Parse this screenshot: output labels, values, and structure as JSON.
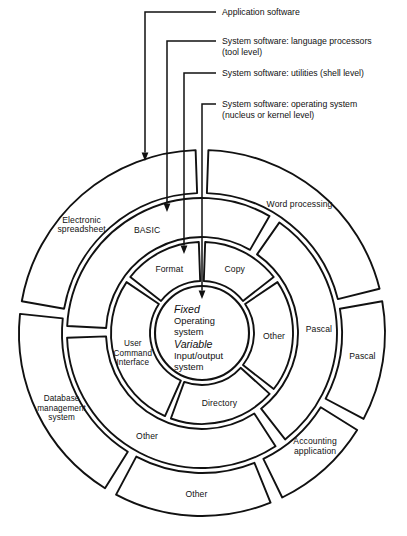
{
  "diagram": {
    "center": {
      "x": 202,
      "y": 333
    },
    "colors": {
      "stroke": "#111111",
      "background": "#ffffff"
    },
    "callouts": [
      {
        "id": "application-software",
        "lines": [
          "Application software"
        ],
        "text_x": 222,
        "text_y": 15,
        "elbow_x": 145,
        "elbow_y": 12,
        "tip_x": 145,
        "tip_y": 161,
        "target_ring": "outer"
      },
      {
        "id": "language-processors",
        "lines": [
          "System software: language processors",
          "(tool level)"
        ],
        "text_x": 222,
        "text_y": 44,
        "elbow_x": 167,
        "elbow_y": 41,
        "tip_x": 167,
        "tip_y": 212,
        "target_ring": "ring2"
      },
      {
        "id": "utilities-shell-level",
        "lines": [
          "System software: utilities (shell level)"
        ],
        "text_x": 222,
        "text_y": 76,
        "elbow_x": 184,
        "elbow_y": 73,
        "tip_x": 184,
        "tip_y": 254,
        "target_ring": "ring3"
      },
      {
        "id": "operating-system-kernel",
        "lines": [
          "System software: operating system",
          "(nucleus or kernel level)"
        ],
        "text_x": 222,
        "text_y": 107,
        "elbow_x": 202,
        "elbow_y": 104,
        "tip_x": 202,
        "tip_y": 299,
        "target_ring": "core"
      }
    ],
    "rings": [
      {
        "id": "outer",
        "name": "application-software-ring",
        "r_outer": 183,
        "r_inner": 140,
        "gap_deg": 3.4,
        "segments": [
          {
            "id": "electronic-spreadsheet",
            "lines": [
              "Electronic",
              "spreadsheet"
            ],
            "start": 190,
            "end": 268,
            "label_deg": 222,
            "label_r": 162
          },
          {
            "id": "word-processing",
            "lines": [
              "Word processing"
            ],
            "start": 272,
            "end": 346,
            "label_deg": 307,
            "label_r": 162
          },
          {
            "id": "pascal-outer",
            "lines": [
              "Pascal"
            ],
            "start": 350,
            "end": 28,
            "label_deg": 8,
            "label_r": 162
          },
          {
            "id": "accounting-application",
            "lines": [
              "Accounting",
              "application"
            ],
            "start": 32,
            "end": 64,
            "label_deg": 45,
            "label_r": 160
          },
          {
            "id": "other-outer",
            "lines": [
              "Other"
            ],
            "start": 68,
            "end": 118,
            "label_deg": 92,
            "label_r": 161
          },
          {
            "id": "database-management-system",
            "lines": [
              "Database",
              "management",
              "system"
            ],
            "start": 122,
            "end": 186,
            "label_deg": 152,
            "label_r": 159
          }
        ]
      },
      {
        "id": "ring2",
        "name": "language-processor-ring",
        "r_outer": 135,
        "r_inner": 96,
        "gap_deg": 4.2,
        "segments": [
          {
            "id": "basic",
            "lines": [
              "BASIC"
            ],
            "start": 183,
            "end": 300,
            "label_deg": 242,
            "label_r": 117
          },
          {
            "id": "pascal",
            "lines": [
              "Pascal"
            ],
            "start": 305,
            "end": 52,
            "label_deg": 358,
            "label_r": 117
          },
          {
            "id": "other-ring2",
            "lines": [
              "Other"
            ],
            "start": 57,
            "end": 178,
            "label_deg": 118,
            "label_r": 117
          }
        ]
      },
      {
        "id": "ring3",
        "name": "utilities-ring",
        "r_outer": 91,
        "r_inner": 52,
        "gap_deg": 6.0,
        "segments": [
          {
            "id": "format",
            "lines": [
              "Format"
            ],
            "start": 218,
            "end": 268,
            "label_deg": 243,
            "label_r": 72
          },
          {
            "id": "copy",
            "lines": [
              "Copy"
            ],
            "start": 272,
            "end": 322,
            "label_deg": 297,
            "label_r": 72
          },
          {
            "id": "other-ring3",
            "lines": [
              "Other"
            ],
            "start": 326,
            "end": 38,
            "label_deg": 2,
            "label_r": 72
          },
          {
            "id": "directory",
            "lines": [
              "Directory"
            ],
            "start": 42,
            "end": 110,
            "label_deg": 76,
            "label_r": 72
          },
          {
            "id": "user-command-interface",
            "lines": [
              "User",
              "Command",
              "Interface"
            ],
            "start": 114,
            "end": 214,
            "label_deg": 164,
            "label_r": 72
          }
        ]
      }
    ],
    "core": {
      "id": "core",
      "name": "operating-system-core",
      "radius": 47,
      "lines": [
        {
          "text": "Fixed",
          "emphasis": true,
          "dy": -20
        },
        {
          "text": "Operating",
          "emphasis": false,
          "dy": -9
        },
        {
          "text": "system",
          "emphasis": false,
          "dy": 2
        },
        {
          "text": "Variable",
          "emphasis": true,
          "dy": 15
        },
        {
          "text": "Input/output",
          "emphasis": false,
          "dy": 26
        },
        {
          "text": "system",
          "emphasis": false,
          "dy": 37
        }
      ],
      "text_x": -28
    }
  }
}
